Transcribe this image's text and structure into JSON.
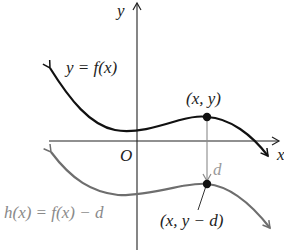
{
  "diagram": {
    "type": "function-graph-vertical-shift",
    "axes": {
      "x_label": "x",
      "y_label": "y",
      "origin_label": "O",
      "axis_color": "#222222"
    },
    "curves": [
      {
        "name": "f",
        "label": "y = f(x)",
        "color": "#111111"
      },
      {
        "name": "h",
        "label": "h(x) = f(x) − d",
        "color": "#6e6e6e"
      }
    ],
    "points": [
      {
        "label": "(x, y)",
        "color": "#111111"
      },
      {
        "label": "(x, y − d)",
        "color": "#111111"
      }
    ],
    "shift": {
      "label": "d",
      "color": "#9a9a9a",
      "direction": "down"
    }
  }
}
